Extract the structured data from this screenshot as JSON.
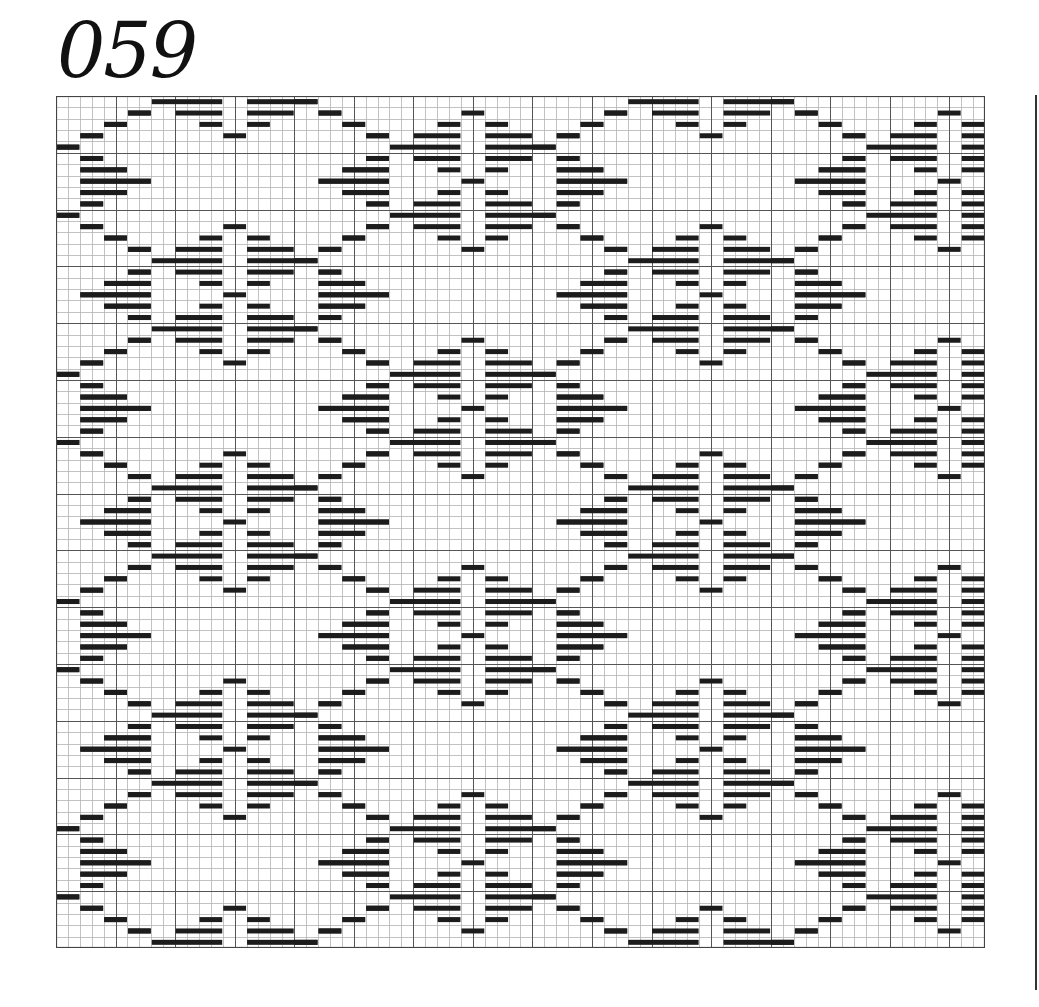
{
  "title": "059",
  "chart_data": {
    "type": "pattern-grid",
    "title": "059",
    "grid": {
      "columns": 78,
      "rows": 75,
      "cell_width": 11.91,
      "cell_height": 11.36,
      "major_every": 5,
      "colors": {
        "minor_line": "#b4b4b4",
        "major_line": "#555555",
        "border": "#444444",
        "bar": "#1c1c1c",
        "background": "#ffffff"
      },
      "bar_thickness": 5
    },
    "repeat": {
      "horizontal_period_cols": 40,
      "vertical_period_rows": 20,
      "half_drop": {
        "col_offset": 20,
        "row_offset": 10
      }
    },
    "base_rows": [
      [
        [
          8,
          14
        ],
        [
          16,
          22
        ]
      ],
      [
        [
          6,
          8
        ],
        [
          10,
          14
        ],
        [
          16,
          20
        ],
        [
          22,
          24
        ]
      ],
      [
        [
          4,
          6
        ],
        [
          12,
          14
        ],
        [
          16,
          18
        ],
        [
          24,
          26
        ]
      ],
      [
        [
          2,
          4
        ],
        [
          14,
          16
        ],
        [
          26,
          28
        ]
      ],
      [
        [
          0,
          2
        ]
      ],
      [
        [
          2,
          4
        ],
        [
          26,
          28
        ]
      ],
      [
        [
          2,
          6
        ],
        [
          24,
          28
        ]
      ],
      [
        [
          2,
          8
        ],
        [
          22,
          28
        ]
      ],
      [
        [
          2,
          6
        ],
        [
          24,
          28
        ]
      ],
      [
        [
          2,
          4
        ],
        [
          26,
          28
        ]
      ],
      [
        [
          0,
          2
        ]
      ],
      [
        [
          2,
          4
        ],
        [
          14,
          16
        ],
        [
          26,
          28
        ]
      ],
      [
        [
          4,
          6
        ],
        [
          12,
          14
        ],
        [
          16,
          18
        ],
        [
          24,
          26
        ]
      ],
      [
        [
          6,
          8
        ],
        [
          10,
          14
        ],
        [
          16,
          20
        ],
        [
          22,
          24
        ]
      ],
      [
        [
          8,
          14
        ],
        [
          16,
          22
        ]
      ],
      [
        [
          6,
          8
        ],
        [
          10,
          14
        ],
        [
          16,
          20
        ],
        [
          22,
          24
        ]
      ],
      [
        [
          4,
          8
        ],
        [
          12,
          14
        ],
        [
          16,
          18
        ],
        [
          22,
          26
        ]
      ],
      [
        [
          2,
          8
        ],
        [
          14,
          16
        ],
        [
          22,
          28
        ]
      ],
      [
        [
          4,
          8
        ],
        [
          12,
          14
        ],
        [
          16,
          18
        ],
        [
          22,
          26
        ]
      ],
      [
        [
          6,
          8
        ],
        [
          10,
          14
        ],
        [
          16,
          20
        ],
        [
          22,
          24
        ]
      ]
    ]
  }
}
